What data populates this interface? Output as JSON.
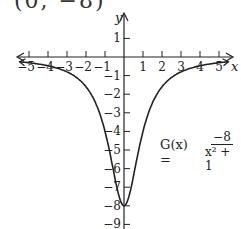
{
  "top_label": "(0, −8)",
  "chart_data": {
    "type": "line",
    "title": "",
    "function_label": "G(x) =",
    "function_numerator": "−8",
    "function_denominator": "x² + 1",
    "xlabel": "x",
    "ylabel": "y",
    "xlim": [
      -5.5,
      5.5
    ],
    "ylim": [
      -9.5,
      1.5
    ],
    "x_ticks": [
      "−5",
      "−4",
      "−3",
      "−2",
      "−1",
      "1",
      "2",
      "3",
      "4",
      "5"
    ],
    "y_ticks": [
      "1",
      "−1",
      "−2",
      "−3",
      "−4",
      "−5",
      "−6",
      "−7",
      "−8",
      "−9"
    ],
    "grid": false,
    "series": [
      {
        "name": "G(x) = -8/(x^2+1)",
        "x": [
          -5.5,
          -5,
          -4,
          -3,
          -2,
          -1.5,
          -1,
          -0.5,
          0,
          0.5,
          1,
          1.5,
          2,
          3,
          4,
          5,
          5.5
        ],
        "y": [
          -0.256,
          -0.308,
          -0.471,
          -0.8,
          -1.6,
          -2.462,
          -4,
          -6.4,
          -8,
          -6.4,
          -4,
          -2.462,
          -1.6,
          -0.8,
          -0.471,
          -0.308,
          -0.256
        ]
      }
    ],
    "highlight_point": {
      "x": 0,
      "y": -8
    }
  }
}
